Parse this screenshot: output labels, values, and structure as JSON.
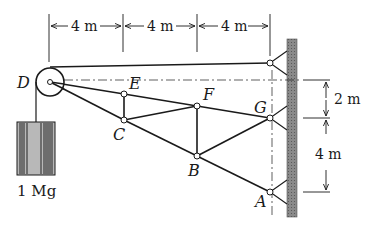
{
  "figure": {
    "type": "truss-diagram",
    "joints": {
      "A": {
        "label": "A"
      },
      "B": {
        "label": "B"
      },
      "C": {
        "label": "C"
      },
      "D": {
        "label": "D"
      },
      "E": {
        "label": "E"
      },
      "F": {
        "label": "F"
      },
      "G": {
        "label": "G"
      }
    },
    "dimensions": {
      "horizontal": [
        "4 m",
        "4 m",
        "4 m"
      ],
      "vertical_top": "2 m",
      "vertical_bottom": "4 m"
    },
    "load": {
      "label": "1 Mg"
    },
    "colors": {
      "ink": "#1a1a1a",
      "wall": "#7a7a7a",
      "weight": "#9a9a9a"
    }
  }
}
